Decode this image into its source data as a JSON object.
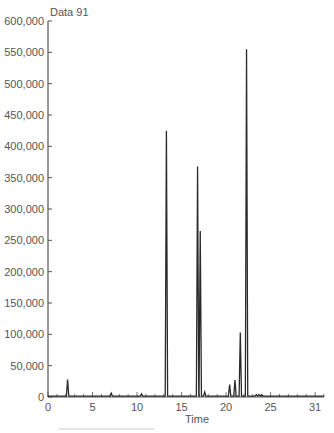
{
  "chart_data": {
    "type": "line",
    "title": "Data 91",
    "xlabel": "Time",
    "ylabel": "",
    "xlim": [
      0,
      31
    ],
    "ylim": [
      0,
      600000
    ],
    "grid": false,
    "legend": null,
    "x_ticks": [
      0,
      5,
      10,
      15,
      20,
      25,
      30
    ],
    "x_tick_labels": [
      "0",
      "5",
      "10",
      "15",
      "20",
      "25",
      "31"
    ],
    "y_ticks": [
      0,
      50000,
      100000,
      150000,
      200000,
      250000,
      300000,
      350000,
      400000,
      450000,
      500000,
      550000,
      600000
    ],
    "y_tick_labels": [
      "0",
      "50,000",
      "100,000",
      "150,000",
      "200,000",
      "250,000",
      "300,000",
      "350,000",
      "400,000",
      "450,000",
      "500,000",
      "550,000",
      "600,000"
    ],
    "peaks": [
      {
        "x": 2.2,
        "y": 28000
      },
      {
        "x": 7.1,
        "y": 6000
      },
      {
        "x": 10.5,
        "y": 5000
      },
      {
        "x": 13.3,
        "y": 425000
      },
      {
        "x": 16.8,
        "y": 368000
      },
      {
        "x": 17.1,
        "y": 265000
      },
      {
        "x": 17.6,
        "y": 8000
      },
      {
        "x": 20.4,
        "y": 20000
      },
      {
        "x": 21.0,
        "y": 27000
      },
      {
        "x": 21.6,
        "y": 103000
      },
      {
        "x": 22.3,
        "y": 555000
      },
      {
        "x": 23.4,
        "y": 4000
      },
      {
        "x": 23.7,
        "y": 4000
      },
      {
        "x": 24.0,
        "y": 3500
      }
    ],
    "baseline": 1500
  },
  "colors": {
    "line": "#2a2a2a",
    "axis": "#555555",
    "text": "#555555"
  }
}
